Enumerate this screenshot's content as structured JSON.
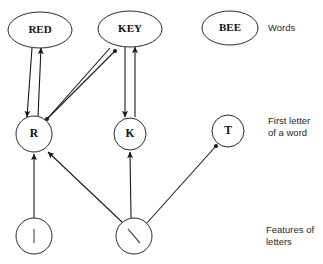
{
  "diagram": {
    "tier_labels": [
      {
        "id": "words",
        "text": "Words"
      },
      {
        "id": "first-letter",
        "text": "First letter\nof a word"
      },
      {
        "id": "features",
        "text": "Features of\nletters"
      }
    ],
    "nodes": [
      {
        "id": "red",
        "label": "RED",
        "tier": "words",
        "shape": "ellipse",
        "cx": 40,
        "cy": 30,
        "rx": 32,
        "ry": 18
      },
      {
        "id": "key",
        "label": "KEY",
        "tier": "words",
        "shape": "ellipse",
        "cx": 130,
        "cy": 29,
        "rx": 32,
        "ry": 18
      },
      {
        "id": "bee",
        "label": "BEE",
        "tier": "words",
        "shape": "ellipse",
        "cx": 230,
        "cy": 28,
        "rx": 28,
        "ry": 17
      },
      {
        "id": "r",
        "label": "R",
        "tier": "first-letter",
        "shape": "circle",
        "cx": 34,
        "cy": 134,
        "rx": 18,
        "ry": 18
      },
      {
        "id": "k",
        "label": "K",
        "tier": "first-letter",
        "shape": "circle",
        "cx": 130,
        "cy": 134,
        "rx": 16,
        "ry": 16
      },
      {
        "id": "t",
        "label": "T",
        "tier": "first-letter",
        "shape": "circle",
        "cx": 228,
        "cy": 131,
        "rx": 16,
        "ry": 16
      },
      {
        "id": "feature-bar",
        "label": "|",
        "tier": "features",
        "shape": "circle",
        "cx": 34,
        "cy": 236,
        "rx": 18,
        "ry": 18,
        "glyph": "vertical-bar"
      },
      {
        "id": "feature-slash",
        "label": "\\",
        "tier": "features",
        "shape": "circle",
        "cx": 134,
        "cy": 236,
        "rx": 18,
        "ry": 18,
        "glyph": "diagonal-slash"
      }
    ],
    "edges": [
      {
        "id": "red-to-r",
        "from": "red",
        "to": "r",
        "style": "arrow",
        "direction": "down",
        "x1": 32,
        "y1": 48,
        "x2": 27,
        "y2": 117
      },
      {
        "id": "r-to-red",
        "from": "r",
        "to": "red",
        "style": "arrow",
        "direction": "up",
        "x1": 38,
        "y1": 117,
        "x2": 41,
        "y2": 48
      },
      {
        "id": "key-to-r",
        "from": "key",
        "to": "r",
        "style": "dot",
        "direction": "down",
        "x1": 110,
        "y1": 48,
        "x2": 47,
        "y2": 119
      },
      {
        "id": "r-to-key",
        "from": "r",
        "to": "key",
        "style": "dot",
        "direction": "up",
        "x1": 43,
        "y1": 123,
        "x2": 115,
        "y2": 51
      },
      {
        "id": "key-to-k",
        "from": "key",
        "to": "k",
        "style": "arrow",
        "direction": "down",
        "x1": 125,
        "y1": 47,
        "x2": 125,
        "y2": 117
      },
      {
        "id": "k-to-key",
        "from": "k",
        "to": "key",
        "style": "arrow",
        "direction": "up",
        "x1": 135,
        "y1": 117,
        "x2": 135,
        "y2": 47
      },
      {
        "id": "bar-to-r",
        "from": "feature-bar",
        "to": "r",
        "style": "arrow",
        "direction": "up",
        "x1": 34,
        "y1": 218,
        "x2": 34,
        "y2": 154
      },
      {
        "id": "slash-to-r",
        "from": "feature-slash",
        "to": "r",
        "style": "arrow",
        "direction": "up",
        "x1": 122,
        "y1": 222,
        "x2": 48,
        "y2": 152
      },
      {
        "id": "slash-to-k",
        "from": "feature-slash",
        "to": "k",
        "style": "arrow",
        "direction": "up",
        "x1": 131,
        "y1": 218,
        "x2": 130,
        "y2": 152
      },
      {
        "id": "slash-to-t",
        "from": "feature-slash",
        "to": "t",
        "style": "dot",
        "direction": "up",
        "x1": 146,
        "y1": 224,
        "x2": 216,
        "y2": 146
      }
    ]
  }
}
